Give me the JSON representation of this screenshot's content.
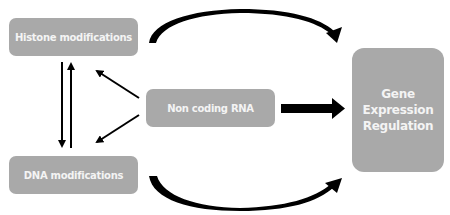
{
  "diagram": {
    "nodes": {
      "histone": {
        "label": "Histone modifications"
      },
      "dna": {
        "label": "DNA modifications"
      },
      "ncrna": {
        "label": "Non coding RNA"
      },
      "gene": {
        "label_lines": [
          "Gene",
          "Expression",
          "Regulation"
        ]
      }
    },
    "edges": [
      {
        "from": "histone",
        "to": "gene",
        "style": "curved-thick"
      },
      {
        "from": "dna",
        "to": "gene",
        "style": "curved-thick"
      },
      {
        "from": "ncrna",
        "to": "gene",
        "style": "block-arrow"
      },
      {
        "from": "ncrna",
        "to": "histone",
        "style": "thin"
      },
      {
        "from": "ncrna",
        "to": "dna",
        "style": "thin"
      },
      {
        "from": "histone",
        "to": "dna",
        "style": "thin"
      },
      {
        "from": "dna",
        "to": "histone",
        "style": "thin"
      }
    ],
    "colors": {
      "box": "#a9a9a9",
      "box_text": "#f4f4f4",
      "arrow": "#000000",
      "background": "#ffffff"
    }
  }
}
